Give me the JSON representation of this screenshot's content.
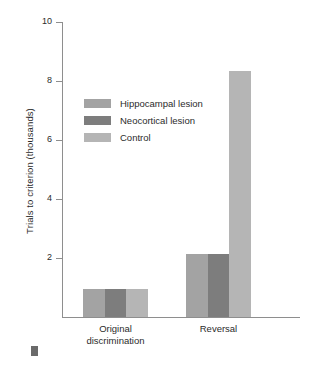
{
  "chart_data": {
    "type": "bar",
    "title": "",
    "subtitle": "",
    "xlabel": "",
    "ylabel": "Trials to criterion (thousands)",
    "categories": [
      "Original discrimination",
      "Reversal"
    ],
    "category_lines": [
      [
        "Original",
        "discrimination"
      ],
      [
        "Reversal"
      ]
    ],
    "series": [
      {
        "name": "Hippocampal lesion",
        "values": [
          0.95,
          2.15
        ],
        "color": "#a3a3a3"
      },
      {
        "name": "Neocortical lesion",
        "values": [
          0.95,
          2.15
        ],
        "color": "#7d7d7d"
      },
      {
        "name": "Control",
        "values": [
          0.95,
          8.35
        ],
        "color": "#b5b5b5"
      }
    ],
    "ylim": [
      0,
      10
    ],
    "yticks": [
      2,
      4,
      6,
      8,
      10
    ],
    "ytick_labels": [
      "2",
      "4",
      "6",
      "8",
      "10"
    ],
    "grid": false,
    "legend_position": "upper-left-inside",
    "axis_color": "#8e8e8e"
  },
  "legend": {
    "items": [
      {
        "label": "Hippocampal lesion",
        "color": "#a3a3a3"
      },
      {
        "label": "Neocortical lesion",
        "color": "#7d7d7d"
      },
      {
        "label": "Control",
        "color": "#b5b5b5"
      }
    ]
  },
  "marker": {
    "name": "figure-bullet",
    "color": "#6a6a6a"
  }
}
